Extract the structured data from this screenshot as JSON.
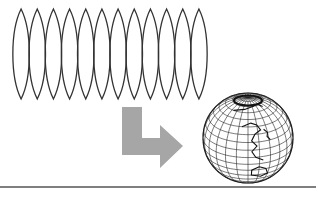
{
  "diagram": {
    "gores": {
      "count": 12,
      "x_start": 13,
      "x_end": 207,
      "y_top": 9,
      "y_bottom": 99,
      "stroke": "#333333"
    },
    "arrow": {
      "label": "transform-arrow",
      "fill": "#a6a6a6"
    },
    "globe": {
      "cx": 248,
      "cy": 138,
      "r": 45,
      "stroke": "#222222",
      "meridians": 12,
      "parallels": 9,
      "view": "Asia-Pacific"
    },
    "rule": {
      "y": 187,
      "color": "#555555"
    }
  }
}
